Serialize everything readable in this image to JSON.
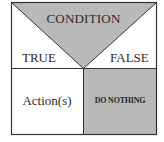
{
  "diagram": {
    "type": "nassi-shneiderman-selection",
    "condition": "CONDITION",
    "true_branch": {
      "label": "TRUE",
      "content": "Action(s)"
    },
    "false_branch": {
      "label": "FALSE",
      "content": "DO NOTHING"
    },
    "colors": {
      "shade": "#b9b9b9",
      "line": "#333333",
      "background": "#ffffff"
    }
  }
}
